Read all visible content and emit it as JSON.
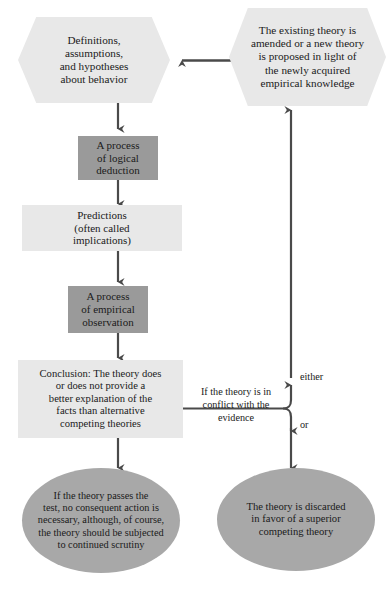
{
  "diagram": {
    "colors": {
      "hexagon_fill": "#e8e8e8",
      "process_fill": "#9a9a9a",
      "light_box_fill": "#e8e8e8",
      "ellipse_fill": "#a8a8a8",
      "connector": "#4a4a4a",
      "text": "#1a1a1a",
      "background": "#ffffff"
    },
    "nodes": {
      "definitions_hex": "Definitions,\nassumptions,\nand hypotheses\nabout behavior",
      "amended_hex": "The existing theory is\namended or a new theory\nis proposed in light of\nthe newly acquired\nempirical knowledge",
      "logical_deduction": "A process\nof logical\ndeduction",
      "predictions": "Predictions\n(often called\nimplications)",
      "empirical_observation": "A process\nof empirical\nobservation",
      "conclusion": "Conclusion: The theory does\nor does not provide a\nbetter explanation of the\nfacts than alternative\ncompeting theories",
      "passes_ellipse": "If the theory passes the\ntest, no consequent action is\nnecessary, although, of course,\nthe theory should be subjected\nto continued scrutiny",
      "discarded_ellipse": "The theory is discarded\nin favor of a superior\ncompeting theory"
    },
    "edge_labels": {
      "conflict": "If the theory is in\nconflict with the\nevidence",
      "either": "either",
      "or": "or"
    }
  }
}
